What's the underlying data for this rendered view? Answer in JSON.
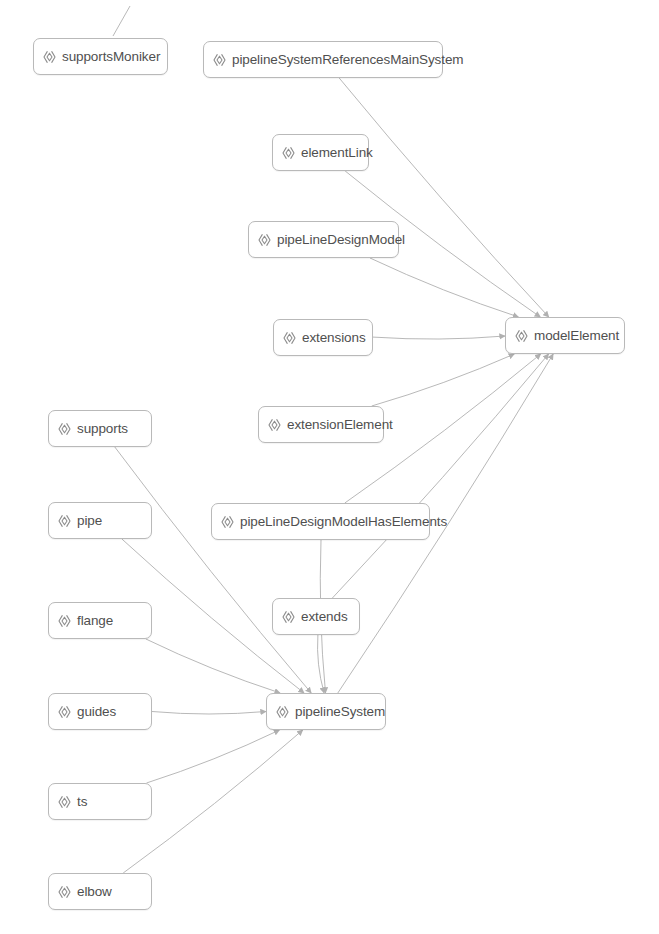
{
  "diagram": {
    "background_color": "#ffffff",
    "node_border_color": "#b9b9b9",
    "node_fill_color": "#ffffff",
    "node_text_color": "#4f4f4f",
    "edge_color": "#b0b0b0",
    "icon_name": "angle-bracket-diamond-icon",
    "width": 659,
    "height": 934
  },
  "nodes": [
    {
      "id": "supportsMoniker",
      "label": "supportsMoniker",
      "x": 33,
      "y": 38,
      "w": 135,
      "h": 37
    },
    {
      "id": "pipelineSystemReferencesMainSystem",
      "label": "pipelineSystemReferencesMainSystem",
      "x": 203,
      "y": 41,
      "w": 240,
      "h": 37
    },
    {
      "id": "elementLink",
      "label": "elementLink",
      "x": 272,
      "y": 134,
      "w": 97,
      "h": 37
    },
    {
      "id": "pipeLineDesignModel",
      "label": "pipeLineDesignModel",
      "x": 248,
      "y": 221,
      "w": 151,
      "h": 37
    },
    {
      "id": "extensions",
      "label": "extensions",
      "x": 273,
      "y": 319,
      "w": 100,
      "h": 37
    },
    {
      "id": "modelElement",
      "label": "modelElement",
      "x": 505,
      "y": 317,
      "w": 120,
      "h": 37
    },
    {
      "id": "extensionElement",
      "label": "extensionElement",
      "x": 258,
      "y": 406,
      "w": 126,
      "h": 37
    },
    {
      "id": "supports",
      "label": "supports",
      "x": 48,
      "y": 410,
      "w": 104,
      "h": 37
    },
    {
      "id": "pipe",
      "label": "pipe",
      "x": 48,
      "y": 502,
      "w": 104,
      "h": 37
    },
    {
      "id": "pipeLineDesignModelHasElements",
      "label": "pipeLineDesignModelHasElements",
      "x": 211,
      "y": 503,
      "w": 219,
      "h": 37
    },
    {
      "id": "flange",
      "label": "flange",
      "x": 48,
      "y": 602,
      "w": 104,
      "h": 37
    },
    {
      "id": "extends",
      "label": "extends",
      "x": 272,
      "y": 598,
      "w": 88,
      "h": 37
    },
    {
      "id": "guides",
      "label": "guides",
      "x": 48,
      "y": 693,
      "w": 104,
      "h": 37
    },
    {
      "id": "pipelineSystem",
      "label": "pipelineSystem",
      "x": 266,
      "y": 693,
      "w": 120,
      "h": 37
    },
    {
      "id": "ts",
      "label": "ts",
      "x": 48,
      "y": 783,
      "w": 104,
      "h": 37
    },
    {
      "id": "elbow",
      "label": "elbow",
      "x": 48,
      "y": 873,
      "w": 104,
      "h": 37
    }
  ],
  "edges": [
    {
      "from": "pipelineSystemReferencesMainSystem",
      "to": "modelElement",
      "kind": "reference"
    },
    {
      "from": "elementLink",
      "to": "modelElement",
      "kind": "reference"
    },
    {
      "from": "pipeLineDesignModel",
      "to": "modelElement",
      "kind": "reference"
    },
    {
      "from": "extensions",
      "to": "modelElement",
      "kind": "reference"
    },
    {
      "from": "extensionElement",
      "to": "modelElement",
      "kind": "reference"
    },
    {
      "from": "pipeLineDesignModelHasElements",
      "to": "modelElement",
      "kind": "reference"
    },
    {
      "from": "extends",
      "to": "modelElement",
      "kind": "reference"
    },
    {
      "from": "pipelineSystem",
      "to": "modelElement",
      "kind": "reference"
    },
    {
      "from": "supports",
      "to": "pipelineSystem",
      "kind": "reference"
    },
    {
      "from": "pipe",
      "to": "pipelineSystem",
      "kind": "reference"
    },
    {
      "from": "flange",
      "to": "pipelineSystem",
      "kind": "reference"
    },
    {
      "from": "guides",
      "to": "pipelineSystem",
      "kind": "reference"
    },
    {
      "from": "ts",
      "to": "pipelineSystem",
      "kind": "reference"
    },
    {
      "from": "elbow",
      "to": "pipelineSystem",
      "kind": "reference"
    },
    {
      "from": "pipeLineDesignModelHasElements",
      "to": "pipelineSystem",
      "kind": "reference"
    },
    {
      "from": "extends",
      "to": "pipelineSystem",
      "kind": "reference"
    }
  ],
  "stub_edges": [
    {
      "name": "supportsMoniker-top-stub",
      "x1": 130,
      "y1": 6,
      "x2": 113,
      "y2": 36
    }
  ]
}
